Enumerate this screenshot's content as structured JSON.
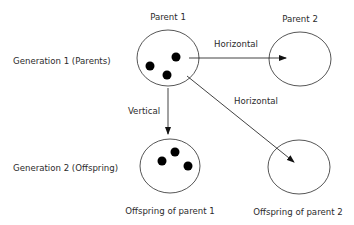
{
  "diagram": {
    "rows": {
      "generation1": "Generation 1 (Parents)",
      "generation2": "Generation 2 (Offspring)"
    },
    "nodes": {
      "parent1": {
        "label": "Parent 1",
        "dots": 3
      },
      "parent2": {
        "label": "Parent 2",
        "dots": 0
      },
      "offspring1": {
        "label": "Offspring of parent 1",
        "dots": 3
      },
      "offspring2": {
        "label": "Offspring of parent 2",
        "dots": 0
      }
    },
    "edges": {
      "p1_to_p2": {
        "label": "Horizontal",
        "from": "Parent 1",
        "to": "Parent 2"
      },
      "p1_to_o2": {
        "label": "Horizontal",
        "from": "Parent 1",
        "to": "Offspring of parent 2"
      },
      "p1_to_o1": {
        "label": "Vertical",
        "from": "Parent 1",
        "to": "Offspring of parent 1"
      }
    },
    "colors": {
      "stroke": "#2b2b2b",
      "dot": "#000000",
      "background": "#ffffff"
    }
  }
}
